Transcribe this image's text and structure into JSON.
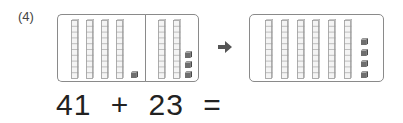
{
  "problem": {
    "label": "(4)",
    "colors": {
      "rod_fill": "#f4f4f4",
      "rod_line": "#9a9a9a",
      "cube_fill": "#6e6e6e",
      "border": "#8a8a8a",
      "arrow": "#555555"
    },
    "left_group": {
      "part_a": {
        "tens": 4,
        "ones": 1
      },
      "part_b": {
        "tens": 2,
        "ones": 3
      }
    },
    "arrow": "right-arrow",
    "result_group": {
      "tens": 6,
      "ones": 4
    },
    "equation": {
      "a": "41",
      "op": "+",
      "b": "23",
      "eq": "="
    }
  }
}
